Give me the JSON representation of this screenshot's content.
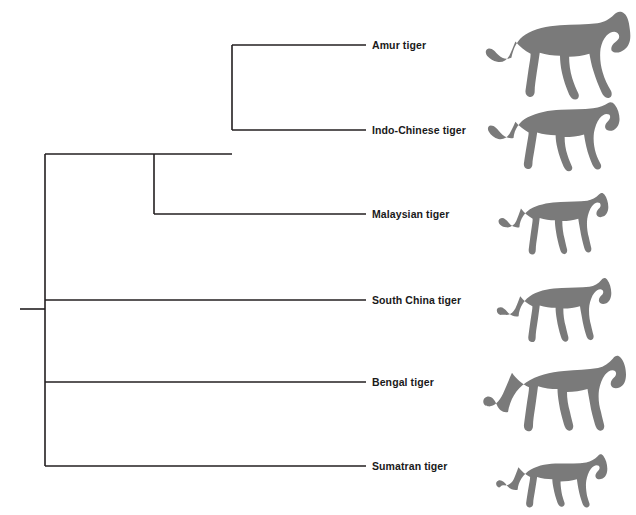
{
  "figure": {
    "kind": "phylogenetic-tree",
    "orientation": "left-to-right-rectangular",
    "background_color": "#ffffff",
    "branch_color": "#231f20",
    "branch_width_px": 1.6,
    "silhouette_color": "#7a7a7a",
    "label_color": "#1a1a1a"
  },
  "taxa": [
    {
      "id": "amur",
      "label": "Amur tiger",
      "tip_y": 45,
      "branch_start_x": 232,
      "branch_end_x": 366,
      "label_x": 372,
      "silhouette_name": "amur-tiger-silhouette",
      "silhouette": {
        "x": 484,
        "y": 8,
        "width": 152,
        "height": 94
      }
    },
    {
      "id": "indo-chinese",
      "label": "Indo-Chinese tiger",
      "tip_y": 130,
      "branch_start_x": 232,
      "branch_end_x": 366,
      "label_x": 372,
      "silhouette_name": "indo-chinese-tiger-silhouette",
      "silhouette": {
        "x": 487,
        "y": 102,
        "width": 142,
        "height": 72
      }
    },
    {
      "id": "malaysian",
      "label": "Malaysian tiger",
      "tip_y": 214,
      "branch_start_x": 154,
      "branch_end_x": 366,
      "label_x": 372,
      "silhouette_name": "malaysian-tiger-silhouette",
      "silhouette": {
        "x": 496,
        "y": 186,
        "width": 117,
        "height": 72
      }
    },
    {
      "id": "south-china",
      "label": "South China tiger",
      "tip_y": 300,
      "branch_start_x": 45,
      "branch_end_x": 366,
      "label_x": 372,
      "silhouette_name": "south-china-tiger-silhouette",
      "silhouette": {
        "x": 495,
        "y": 272,
        "width": 122,
        "height": 72
      }
    },
    {
      "id": "bengal",
      "label": "Bengal tiger",
      "tip_y": 382,
      "branch_start_x": 45,
      "branch_end_x": 366,
      "label_x": 372,
      "silhouette_name": "bengal-tiger-silhouette",
      "silhouette": {
        "x": 482,
        "y": 348,
        "width": 150,
        "height": 86
      }
    },
    {
      "id": "sumatran",
      "label": "Sumatran tiger",
      "tip_y": 466,
      "branch_start_x": 45,
      "branch_end_x": 366,
      "label_x": 372,
      "silhouette_name": "sumatran-tiger-silhouette",
      "silhouette": {
        "x": 495,
        "y": 450,
        "width": 117,
        "height": 60
      }
    }
  ],
  "nodes": [
    {
      "id": "root",
      "name": "root-node",
      "x": 45,
      "stub_from_x": 20,
      "stub_y": 309,
      "vertical_top_y": 154,
      "vertical_bottom_y": 466,
      "children_y": [
        154,
        300,
        382,
        466
      ]
    },
    {
      "id": "node-mainland-clade",
      "name": "internal-node-malaysian-split",
      "x": 154,
      "parent_y": 154,
      "vertical_top_y": 154,
      "vertical_bottom_y": 214,
      "children_y": [
        154,
        214
      ]
    },
    {
      "id": "node-amur-indochinese",
      "name": "internal-node-amur-indochinese-split",
      "x": 232,
      "parent_y": 154,
      "vertical_top_y": 45,
      "vertical_bottom_y": 130,
      "children_y": [
        45,
        130
      ]
    }
  ],
  "chart_data": {
    "type": "tree",
    "title": "",
    "xlabel": "",
    "ylabel": "",
    "tip_labels": [
      "Amur tiger",
      "Indo-Chinese tiger",
      "Malaysian tiger",
      "South China tiger",
      "Bengal tiger",
      "Sumatran tiger"
    ],
    "newick": "(((Amur tiger,Indo-Chinese tiger),Malaysian tiger),South China tiger,Bengal tiger,Sumatran tiger);",
    "clades": [
      {
        "name": "Amur + Indo-Chinese",
        "members": [
          "Amur tiger",
          "Indo-Chinese tiger"
        ],
        "node_x": 232
      },
      {
        "name": "Amur + Indo-Chinese + Malaysian",
        "members": [
          "Amur tiger",
          "Indo-Chinese tiger",
          "Malaysian tiger"
        ],
        "node_x": 154
      },
      {
        "name": "All tigers (root)",
        "members": [
          "Amur tiger",
          "Indo-Chinese tiger",
          "Malaysian tiger",
          "South China tiger",
          "Bengal tiger",
          "Sumatran tiger"
        ],
        "node_x": 45
      }
    ]
  }
}
